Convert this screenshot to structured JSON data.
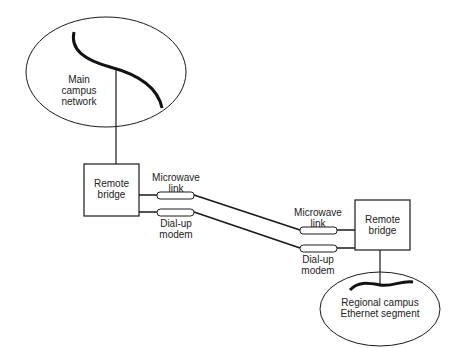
{
  "diagram": {
    "main_network": {
      "label": "Main\ncampus\nnetwork"
    },
    "left_bridge": {
      "label": "Remote\nbridge"
    },
    "right_bridge": {
      "label": "Remote\nbridge"
    },
    "left_microwave": {
      "label": "Microwave\nlink"
    },
    "left_dialup": {
      "label": "Dial-up\nmodem"
    },
    "right_microwave": {
      "label": "Microwave\nlink"
    },
    "right_dialup": {
      "label": "Dial-up\nmodem"
    },
    "regional_network": {
      "label": "Regional campus\nEthernet segment"
    },
    "colors": {
      "stroke": "#1a1a1a",
      "text": "#222222",
      "background": "#ffffff"
    }
  }
}
